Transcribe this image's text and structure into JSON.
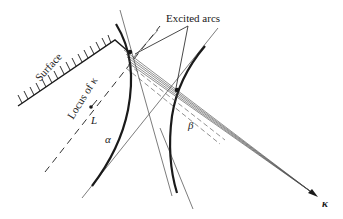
{
  "diagram": {
    "type": "kikuchi-excited-arcs",
    "labels": {
      "excited_arcs": "Excited arcs",
      "surface": "Surface",
      "locus": "Locus of κ",
      "point_L": "L",
      "arc_alpha": "α",
      "arc_beta": "β",
      "kappa": "κ"
    },
    "colors": {
      "ink": "#1a1a1a",
      "thin_line": "#444444",
      "background": "#ffffff"
    },
    "elements": [
      {
        "id": "surface",
        "kind": "hatched-boundary"
      },
      {
        "id": "locus",
        "kind": "dashed-line"
      },
      {
        "id": "point-L",
        "kind": "point"
      },
      {
        "id": "arc-alpha",
        "kind": "thick-curve"
      },
      {
        "id": "arc-beta",
        "kind": "thick-curve"
      },
      {
        "id": "tangent-lines",
        "kind": "thin-lines"
      },
      {
        "id": "kappa-bundle",
        "kind": "converging-lines-with-arrow"
      },
      {
        "id": "leaders",
        "kind": "label-leader-lines"
      }
    ]
  }
}
